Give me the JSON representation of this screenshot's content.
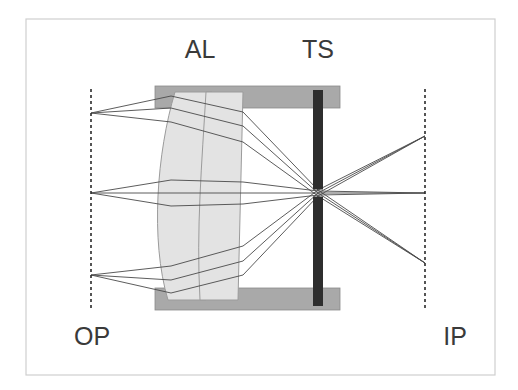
{
  "figure": {
    "kind": "optical-ray-diagram",
    "background_color": "#ffffff",
    "border_color": "#cfcfcf",
    "border": {
      "x": 26,
      "y": 19,
      "width": 469,
      "height": 356
    }
  },
  "labels": {
    "lens": "AL",
    "stop": "TS",
    "object_plane": "OP",
    "image_plane": "IP",
    "lens_pos": {
      "x": 200,
      "y": 58
    },
    "stop_pos": {
      "x": 318,
      "y": 58
    },
    "object_plane_pos": {
      "x": 92,
      "y": 345
    },
    "image_plane_pos": {
      "x": 455,
      "y": 345
    },
    "font_size": 25,
    "color": "#3a3a3a"
  },
  "planes": {
    "object_plane": {
      "x": 91,
      "y_top": 89,
      "y_bottom": 310,
      "style": "dashed",
      "color": "#2b2b2b"
    },
    "image_plane": {
      "x": 425,
      "y_top": 89,
      "y_bottom": 310,
      "style": "dashed",
      "color": "#2b2b2b"
    }
  },
  "housing": {
    "color": "#a9a9a9",
    "stroke": "#8a8a8a",
    "x": 155,
    "width": 185,
    "top_bar": {
      "y": 86,
      "height": 22
    },
    "bottom_bar": {
      "y": 288,
      "height": 22
    }
  },
  "lens": {
    "name": "aspheric-lens",
    "fill": "#e3e3e3",
    "stroke": "#9b9b9b",
    "element_front": {
      "x_left_top": 175,
      "x_left_bottom": 168,
      "x_right_top": 212,
      "x_right_bottom": 206,
      "y_top": 92,
      "y_bottom": 300,
      "bulge": 18
    },
    "element_rear": {
      "x_left_top": 206,
      "x_right_top": 243,
      "x_left_bottom": 200,
      "x_right_bottom": 238,
      "y_top": 92,
      "y_bottom": 300
    }
  },
  "stop": {
    "name": "test-stop",
    "color": "#2e2e2e",
    "x": 313,
    "width": 10,
    "y_top": 90,
    "y_bottom": 306,
    "aperture_y": 193,
    "aperture_height": 7
  },
  "optical_axis": {
    "y": 193,
    "color": "#555555"
  },
  "focus_point": {
    "x": 318,
    "y": 193
  },
  "ray_color": "#4a4a4a",
  "ray_width": 0.9,
  "chart_data": {
    "type": "line",
    "xlabel": "Optical axis position (px)",
    "ylabel": "Height (px)",
    "xlim": [
      91,
      425
    ],
    "ylim": [
      89,
      310
    ],
    "grid": false,
    "legend": false,
    "annotations": [
      "AL",
      "TS",
      "OP",
      "IP"
    ],
    "object_points": [
      {
        "name": "upper-field-point",
        "x": 91,
        "y": 113
      },
      {
        "name": "axial-point",
        "x": 91,
        "y": 193
      },
      {
        "name": "lower-field-point",
        "x": 91,
        "y": 275
      }
    ],
    "image_points": [
      {
        "name": "lower-image-point",
        "x": 425,
        "y": 263
      },
      {
        "name": "axial-image-point",
        "x": 425,
        "y": 193
      },
      {
        "name": "upper-image-point",
        "x": 425,
        "y": 136
      }
    ],
    "stop_aperture": {
      "x": 318,
      "y": 193
    },
    "bundles": [
      {
        "name": "upper-bundle",
        "source": {
          "x": 91,
          "y": 113
        },
        "image": {
          "x": 425,
          "y": 263
        },
        "rays": [
          {
            "lens_in_y": 96,
            "lens_out_y": 112,
            "stop_y": 190
          },
          {
            "lens_in_y": 108,
            "lens_out_y": 126,
            "stop_y": 193
          },
          {
            "lens_in_y": 122,
            "lens_out_y": 142,
            "stop_y": 196
          }
        ]
      },
      {
        "name": "axial-bundle",
        "source": {
          "x": 91,
          "y": 193
        },
        "image": {
          "x": 425,
          "y": 193
        },
        "rays": [
          {
            "lens_in_y": 180,
            "lens_out_y": 182,
            "stop_y": 191
          },
          {
            "lens_in_y": 193,
            "lens_out_y": 193,
            "stop_y": 193
          },
          {
            "lens_in_y": 206,
            "lens_out_y": 204,
            "stop_y": 195
          }
        ]
      },
      {
        "name": "lower-bundle",
        "source": {
          "x": 91,
          "y": 275
        },
        "image": {
          "x": 425,
          "y": 136
        },
        "rays": [
          {
            "lens_in_y": 266,
            "lens_out_y": 246,
            "stop_y": 190
          },
          {
            "lens_in_y": 280,
            "lens_out_y": 261,
            "stop_y": 193
          },
          {
            "lens_in_y": 293,
            "lens_out_y": 275,
            "stop_y": 196
          }
        ]
      }
    ]
  }
}
